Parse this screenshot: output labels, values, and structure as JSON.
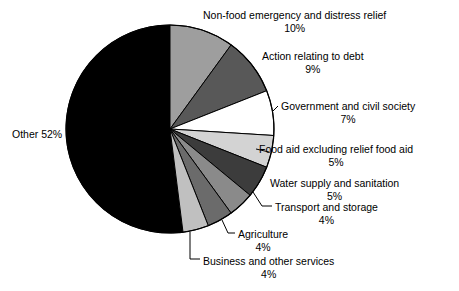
{
  "chart_data": {
    "type": "pie",
    "title": "",
    "subtitle": "",
    "xlabel": "",
    "ylabel": "",
    "legend_position": "none",
    "grid": false,
    "value_unit": "%",
    "start_angle_deg": 0,
    "direction": "clockwise",
    "categories": [
      "Non-food emergency and distress relief",
      "Action relating to debt",
      "Government and civil society",
      "Food aid excluding relief food aid",
      "Water supply and sanitation",
      "Transport and storage",
      "Agriculture",
      "Business and other services",
      "Other"
    ],
    "values": [
      10,
      9,
      7,
      5,
      5,
      4,
      4,
      4,
      52
    ],
    "slices": [
      {
        "label": "Non-food emergency and distress relief",
        "percent_text": "10%",
        "value": 10,
        "color": "#9e9e9e",
        "has_leader_line": false
      },
      {
        "label": "Action relating to debt",
        "percent_text": "9%",
        "value": 9,
        "color": "#585858",
        "has_leader_line": false
      },
      {
        "label": "Government and civil society",
        "percent_text": "7%",
        "value": 7,
        "color": "#ffffff",
        "has_leader_line": true
      },
      {
        "label": "Food aid excluding relief food aid",
        "percent_text": "5%",
        "value": 5,
        "color": "#d3d3d3",
        "has_leader_line": true
      },
      {
        "label": "Water supply and sanitation",
        "percent_text": "5%",
        "value": 5,
        "color": "#3c3c3c",
        "has_leader_line": false
      },
      {
        "label": "Transport and storage",
        "percent_text": "4%",
        "value": 4,
        "color": "#8a8a8a",
        "has_leader_line": true
      },
      {
        "label": "Agriculture",
        "percent_text": "4%",
        "value": 4,
        "color": "#6b6b6b",
        "has_leader_line": true
      },
      {
        "label": "Business and other services",
        "percent_text": "4%",
        "value": 4,
        "color": "#c0c0c0",
        "has_leader_line": true
      },
      {
        "label": "Other",
        "percent_text": "52%",
        "value": 52,
        "color": "#000000",
        "has_leader_line": false,
        "label_inline": "Other 52%"
      }
    ],
    "colors": {
      "outline": "#000000",
      "background": "#ffffff",
      "text": "#000000"
    }
  }
}
